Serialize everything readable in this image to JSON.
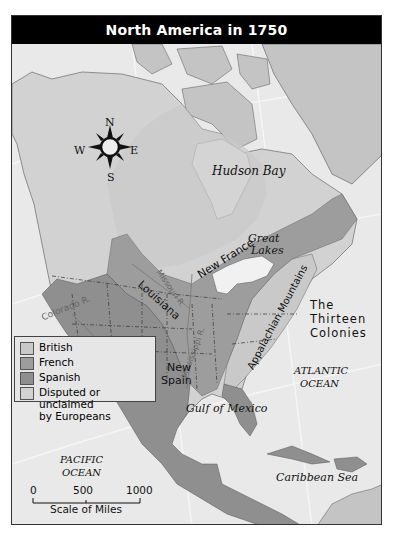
{
  "title": "North America in 1750",
  "colors": {
    "title_bg": "#000000",
    "title_text": "#ffffff",
    "water": "#e9e9e9",
    "british": "#c9c9c9",
    "french": "#9d9d9d",
    "spanish": "#8f8f8f",
    "disputed": "#c4c4c4",
    "ice_land": "#bdbdbd"
  },
  "compass": {
    "icon": "compass-rose-icon",
    "n": "N",
    "s": "S",
    "e": "E",
    "w": "W"
  },
  "labels": {
    "hudson_bay": "Hudson Bay",
    "great_lakes_1": "Great",
    "great_lakes_2": "Lakes",
    "new_france": "New France",
    "louisiana": "Louisiana",
    "missouri_r": "Missouri R.",
    "mississippi_r": "Mississippi R.",
    "colorado_r": "Colorado R.",
    "appalachian": "Appalachian Mountains",
    "thirteen_1": "The",
    "thirteen_2": "Thirteen",
    "thirteen_3": "Colonies",
    "new_spain_1": "New",
    "new_spain_2": "Spain",
    "atlantic_1": "ATLANTIC",
    "atlantic_2": "OCEAN",
    "gulf": "Gulf of Mexico",
    "pacific_1": "PACIFIC",
    "pacific_2": "OCEAN",
    "caribbean": "Caribbean Sea"
  },
  "legend": {
    "items": [
      {
        "label": "British",
        "color": "#c9c9c9"
      },
      {
        "label": "French",
        "color": "#9d9d9d"
      },
      {
        "label": "Spanish",
        "color": "#8f8f8f"
      },
      {
        "label": "Disputed or unclaimed",
        "label2": "by Europeans",
        "color": "#d2d2d2"
      }
    ]
  },
  "scale": {
    "ticks": [
      "0",
      "500",
      "1000"
    ],
    "label": "Scale of Miles"
  }
}
